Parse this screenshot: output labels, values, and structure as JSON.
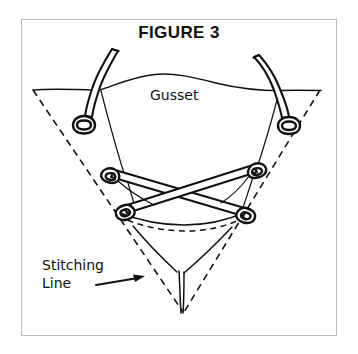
{
  "figure": {
    "title": "FIGURE 3",
    "frame_color": "#b9b9b9",
    "ink_color": "#111111",
    "background_color": "#ffffff"
  },
  "labels": {
    "gusset": "Gusset",
    "stitching_line_1": "Stitching",
    "stitching_line_2": "Line"
  },
  "annotations": {
    "arrow_target": "stitching-line-dashed-edge"
  },
  "diagram": {
    "elements": [
      "top-left-stitch-cord",
      "top-right-stitch-cord",
      "crossed-lacing-cords",
      "dashed-stitching-line",
      "gusset-outline",
      "gusset-bottom-point"
    ]
  }
}
